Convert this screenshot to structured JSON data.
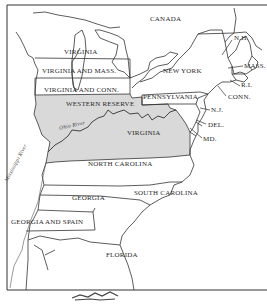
{
  "map": {
    "title": "",
    "colors": {
      "shaded_region": "#d9d9d9",
      "line": "#333333",
      "background": "#ffffff"
    },
    "regions": [
      {
        "id": "canada",
        "label": "CANADA"
      },
      {
        "id": "virginia-north",
        "label": "VIRGINIA"
      },
      {
        "id": "virginia-mass",
        "label": "VIRGINIA AND MASS."
      },
      {
        "id": "virginia-conn",
        "label": "VIRGINIA AND CONN."
      },
      {
        "id": "western-reserve",
        "label": "WESTERN RESERVE",
        "shaded": true
      },
      {
        "id": "virginia-kentucky",
        "label": "VIRGINIA",
        "shaded": true
      },
      {
        "id": "new-york",
        "label": "NEW YORK"
      },
      {
        "id": "pennsylvania",
        "label": "PENNSYLVANIA"
      },
      {
        "id": "north-carolina",
        "label": "NORTH CAROLINA"
      },
      {
        "id": "south-carolina",
        "label": "SOUTH CAROLINA"
      },
      {
        "id": "georgia",
        "label": "GEORGIA"
      },
      {
        "id": "georgia-spain",
        "label": "GEORGIA AND SPAIN"
      },
      {
        "id": "florida",
        "label": "FLORIDA"
      }
    ],
    "callouts": [
      {
        "id": "nh",
        "label": "N.H."
      },
      {
        "id": "mass",
        "label": "MASS."
      },
      {
        "id": "ri",
        "label": "R.I."
      },
      {
        "id": "conn",
        "label": "CONN."
      },
      {
        "id": "nj",
        "label": "N.J."
      },
      {
        "id": "del",
        "label": "DEL."
      },
      {
        "id": "md",
        "label": "MD."
      }
    ],
    "rivers": [
      {
        "id": "ohio",
        "label": "Ohio River"
      },
      {
        "id": "mississippi",
        "label": "Mississippi River"
      }
    ]
  }
}
